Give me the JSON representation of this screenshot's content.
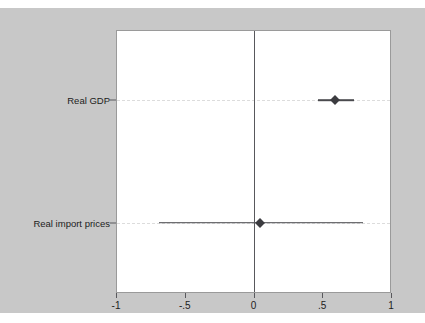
{
  "chart_data": {
    "type": "scatter",
    "subtype": "coefficient-forest-plot",
    "title": "",
    "xlabel": "",
    "ylabel": "",
    "xlim": [
      -1,
      1
    ],
    "xticks": [
      -1,
      -0.5,
      0,
      0.5,
      1
    ],
    "xtick_labels": [
      "-1",
      "-.5",
      "0",
      ".5",
      "1"
    ],
    "grid": true,
    "grid_orientation": "horizontal",
    "grid_style": "dashed",
    "legend": "none",
    "reference_line": {
      "value": 0,
      "orientation": "vertical",
      "color": "#58585c"
    },
    "categories": [
      "Real GDP",
      "Real import prices"
    ],
    "points": [
      {
        "label": "Real GDP",
        "estimate": 0.6,
        "ci_low": 0.47,
        "ci_high": 0.74,
        "row_position": 0.735,
        "crosses_zero": false
      },
      {
        "label": "Real import prices",
        "estimate": 0.05,
        "ci_low": -0.69,
        "ci_high": 0.8,
        "row_position": 0.265,
        "crosses_zero": true
      }
    ],
    "colors": {
      "marker": "#3c3c40",
      "interval": "#4a4a4e",
      "gridline": "#dcdcdc",
      "plot_background": "#ffffff",
      "graph_background": "#c8c8c8",
      "axis": "#58585c",
      "text": "#1c1c1c"
    }
  }
}
